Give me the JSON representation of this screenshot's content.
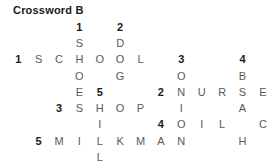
{
  "title": "Crossword B",
  "colors": {
    "background": "#ffffff",
    "letter": "#58595b",
    "clue_number": "#1a1a1a",
    "title": "#1a1a1a"
  },
  "grid": {
    "columns": 12,
    "rows": [
      [
        "",
        "",
        "",
        "1",
        "",
        "2",
        "",
        "",
        "",
        "",
        "",
        ""
      ],
      [
        "",
        "",
        "",
        "S",
        "",
        "D",
        "",
        "",
        "",
        "",
        "",
        ""
      ],
      [
        "1",
        "S",
        "C",
        "H",
        "O",
        "O",
        "L",
        "",
        "3",
        "",
        "",
        "4"
      ],
      [
        "",
        "",
        "",
        "O",
        "",
        "G",
        "",
        "",
        "O",
        "",
        "",
        "B"
      ],
      [
        "",
        "",
        "",
        "E",
        "5",
        "",
        "",
        "2",
        "N",
        "U",
        "R",
        "S",
        "E"
      ],
      [
        "",
        "",
        "3",
        "S",
        "H",
        "O",
        "P",
        "",
        "I",
        "",
        "",
        "A"
      ],
      [
        "",
        "",
        "",
        "",
        "I",
        "",
        "",
        "4",
        "O",
        "I",
        "L",
        "",
        "C"
      ],
      [
        "",
        "5",
        "M",
        "I",
        "L",
        "K",
        "M",
        "A",
        "N",
        "",
        "",
        "H"
      ],
      [
        "",
        "",
        "",
        "",
        "L",
        "",
        "",
        "",
        "",
        "",
        "",
        ""
      ]
    ],
    "clue_numbers": [
      "1",
      "2",
      "3",
      "4",
      "5"
    ]
  },
  "answers": {
    "across": [
      {
        "number": "1",
        "word": "SCHOOL"
      },
      {
        "number": "2",
        "word": "NURSE"
      },
      {
        "number": "3",
        "word": "SHOP"
      },
      {
        "number": "4",
        "word": "OIL"
      },
      {
        "number": "5",
        "word": "MILKMAN"
      }
    ],
    "down": [
      {
        "number": "1",
        "word": "SHOES"
      },
      {
        "number": "2",
        "word": "DOG"
      },
      {
        "number": "3",
        "word": "ONION"
      },
      {
        "number": "4",
        "word": "BEACH"
      },
      {
        "number": "5",
        "word": "HILL"
      }
    ]
  }
}
